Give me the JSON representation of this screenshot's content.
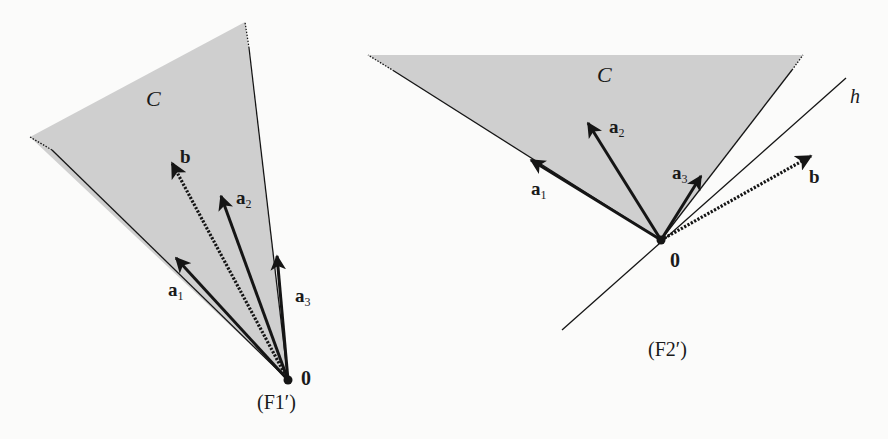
{
  "figures": [
    {
      "id": "F1",
      "caption": "(F1′)",
      "cone_label": "C",
      "origin_label": "0",
      "vectors": [
        {
          "name": "a",
          "sub": "1",
          "style": "solid"
        },
        {
          "name": "a",
          "sub": "2",
          "style": "solid"
        },
        {
          "name": "a",
          "sub": "3",
          "style": "solid"
        },
        {
          "name": "b",
          "sub": "",
          "style": "dotted"
        }
      ]
    },
    {
      "id": "F2",
      "caption": "(F2′)",
      "cone_label": "C",
      "origin_label": "0",
      "hyperplane_label": "h",
      "vectors": [
        {
          "name": "a",
          "sub": "1",
          "style": "solid"
        },
        {
          "name": "a",
          "sub": "2",
          "style": "solid"
        },
        {
          "name": "a",
          "sub": "3",
          "style": "solid"
        },
        {
          "name": "b",
          "sub": "",
          "style": "dotted"
        }
      ]
    }
  ],
  "colors": {
    "cone_fill": "#cfcfcf",
    "ink": "#151515",
    "background": "#fbfbfa"
  }
}
